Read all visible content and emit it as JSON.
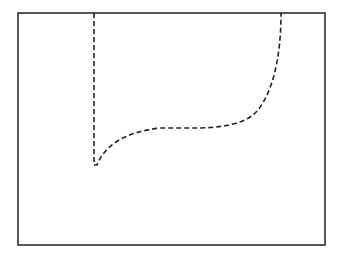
{
  "diagram": {
    "frame": {
      "x": 18,
      "y": 13,
      "width": 307,
      "height": 232,
      "stroke": "#222222"
    },
    "curve": {
      "stroke": "#222222",
      "dash": "5,3",
      "path": "M 94 13 L 94 165 L 97 165 C 105 145, 125 132, 160 128 L 200 128 C 230 127, 248 122, 258 110 C 272 92, 281 60, 281 13"
    }
  }
}
